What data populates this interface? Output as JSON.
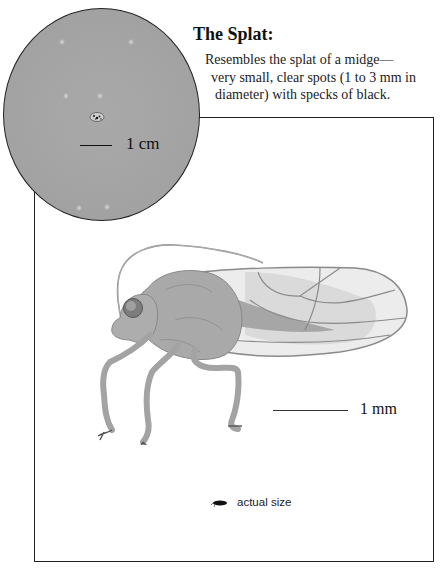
{
  "heading": {
    "title": "The Splat:",
    "description_lines": [
      "Resembles the splat of a midge—",
      "very small, clear spots (1 to 3 mm in",
      "diameter) with specks of black."
    ]
  },
  "magnified_view": {
    "scale_label": "1 cm",
    "background_color": "#a4a4a4"
  },
  "specimen_illustration": {
    "scale_label": "1 mm",
    "actual_size_label": "actual size",
    "line_color": "#7a7a7a",
    "body_color": "#a8a8a8"
  }
}
